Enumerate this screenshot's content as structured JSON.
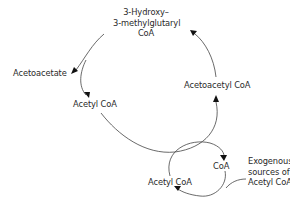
{
  "diagram": {
    "nodes": {
      "hmg_coa": [
        "3-Hydroxy–",
        "3-methylglutaryl",
        "CoA"
      ],
      "acetoacetate": "Acetoacetate",
      "acetyl_coa_upper": "Acetyl CoA",
      "acetoacetyl_coa": "Acetoacetyl CoA",
      "coa": "CoA",
      "acetyl_coa_lower": "Acetyl CoA",
      "exogenous": [
        "Exogenous",
        "sources of",
        "Acetyl CoA"
      ]
    },
    "edges": [
      {
        "from": "hmg_coa",
        "to": "acetoacetate"
      },
      {
        "from": "hmg_coa",
        "to": "acetyl_coa_upper"
      },
      {
        "from": "acetyl_coa_upper",
        "to": "acetoacetyl_coa"
      },
      {
        "from": "acetoacetyl_coa",
        "to": "hmg_coa"
      },
      {
        "from": "acetyl_coa_lower",
        "to": "coa"
      },
      {
        "from": "exogenous",
        "to": "acetyl_coa_lower"
      }
    ],
    "colors": {
      "line": "#444444",
      "text": "#2a2a2a",
      "background": "#ffffff"
    }
  }
}
